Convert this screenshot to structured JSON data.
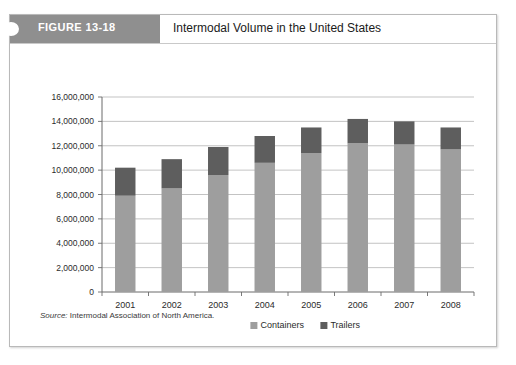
{
  "figure": {
    "tag_label": "FIGURE 13-18",
    "title": "Intermodal Volume in the United States",
    "source_prefix": "Source:",
    "source_text": "Intermodal Association of North America."
  },
  "colors": {
    "tag_band": "#8f8f8f",
    "containers": "#9e9e9e",
    "trailers": "#5e5e5e",
    "gridline": "#a9a9a9",
    "axis": "#6b6b6b",
    "card_border": "#b9b9b9"
  },
  "chart_data": {
    "type": "bar",
    "subtype": "stacked-column",
    "title": "Intermodal Volume in the United States",
    "xlabel": "",
    "ylabel": "",
    "ylim": [
      0,
      16000000
    ],
    "ytick_step": 2000000,
    "grid": true,
    "legend_position": "bottom",
    "categories": [
      "2001",
      "2002",
      "2003",
      "2004",
      "2005",
      "2006",
      "2007",
      "2008"
    ],
    "ytick_labels": [
      "0",
      "2,000,000",
      "4,000,000",
      "6,000,000",
      "8,000,000",
      "10,000,000",
      "12,000,000",
      "14,000,000",
      "16,000,000"
    ],
    "series": [
      {
        "name": "Containers",
        "color": "#9e9e9e",
        "values": [
          7900000,
          8500000,
          9600000,
          10600000,
          11400000,
          12200000,
          12100000,
          11700000
        ]
      },
      {
        "name": "Trailers",
        "color": "#5e5e5e",
        "values": [
          2300000,
          2400000,
          2300000,
          2200000,
          2100000,
          2000000,
          1900000,
          1800000
        ]
      }
    ],
    "totals": [
      10200000,
      10900000,
      11900000,
      12800000,
      13500000,
      14200000,
      14000000,
      13500000
    ]
  }
}
